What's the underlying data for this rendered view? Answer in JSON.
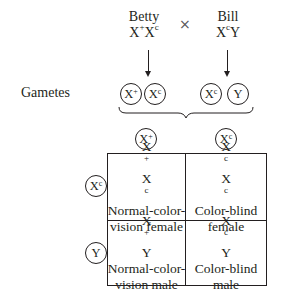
{
  "cross": {
    "mother": {
      "name": "Betty",
      "genotype_base": "X",
      "genotype_sup1": "+",
      "genotype_mid": "X",
      "genotype_sup2": "c"
    },
    "symbol": "×",
    "father": {
      "name": "Bill",
      "genotype_base": "X",
      "genotype_sup1": "c",
      "genotype_mid": "Y"
    }
  },
  "gametes": {
    "label": "Gametes",
    "mother": [
      {
        "base": "X",
        "sup": "+"
      },
      {
        "base": "X",
        "sup": "c"
      }
    ],
    "father": [
      {
        "base": "X",
        "sup": "c"
      },
      {
        "base": "Y",
        "sup": ""
      }
    ]
  },
  "punnett": {
    "columns": [
      {
        "base": "X",
        "sup": "+"
      },
      {
        "base": "X",
        "sup": "c"
      }
    ],
    "rows": [
      {
        "base": "X",
        "sup": "c"
      },
      {
        "base": "Y",
        "sup": ""
      }
    ],
    "cells": [
      [
        {
          "g1": "X",
          "s1": "+",
          "g2": "X",
          "s2": "c",
          "line1": "Normal-color-",
          "line2": "vision female"
        },
        {
          "g1": "X",
          "s1": "c",
          "g2": "X",
          "s2": "c",
          "line1": "Color-blind",
          "line2": "female"
        }
      ],
      [
        {
          "g1": "X",
          "s1": "+",
          "g2": "Y",
          "s2": "",
          "line1": "Normal-color-",
          "line2": "vision male"
        },
        {
          "g1": "X",
          "s1": "c",
          "g2": "Y",
          "s2": "",
          "line1": "Color-blind",
          "line2": "male"
        }
      ]
    ]
  }
}
